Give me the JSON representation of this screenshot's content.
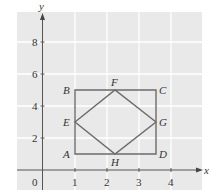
{
  "diagram": {
    "type": "coordinate-plane-figure",
    "axes": {
      "x_label": "x",
      "y_label": "y",
      "origin_label": "0",
      "x_ticks": [
        {
          "value": 1,
          "label": "1"
        },
        {
          "value": 2,
          "label": "2"
        },
        {
          "value": 3,
          "label": "3"
        },
        {
          "value": 4,
          "label": "4"
        }
      ],
      "y_ticks": [
        {
          "value": 2,
          "label": "2"
        },
        {
          "value": 4,
          "label": "4"
        },
        {
          "value": 6,
          "label": "6"
        },
        {
          "value": 8,
          "label": "8"
        }
      ],
      "grid": true
    },
    "points": [
      {
        "name": "A",
        "x": 1,
        "y": 1
      },
      {
        "name": "B",
        "x": 1,
        "y": 5
      },
      {
        "name": "C",
        "x": 3.5,
        "y": 5
      },
      {
        "name": "D",
        "x": 3.5,
        "y": 1
      },
      {
        "name": "E",
        "x": 1,
        "y": 3
      },
      {
        "name": "F",
        "x": 2.25,
        "y": 5
      },
      {
        "name": "G",
        "x": 3.5,
        "y": 3
      },
      {
        "name": "H",
        "x": 2.25,
        "y": 1
      }
    ],
    "shapes": [
      {
        "name": "rectangle",
        "vertices": [
          "A",
          "B",
          "C",
          "D"
        ]
      },
      {
        "name": "rhombus",
        "vertices": [
          "E",
          "F",
          "G",
          "H"
        ]
      }
    ],
    "colors": {
      "background": "#e9e9e9",
      "grid": "#ffffff",
      "axis": "#555555",
      "shape_stroke": "#6b6b6b",
      "text": "#333333"
    }
  }
}
